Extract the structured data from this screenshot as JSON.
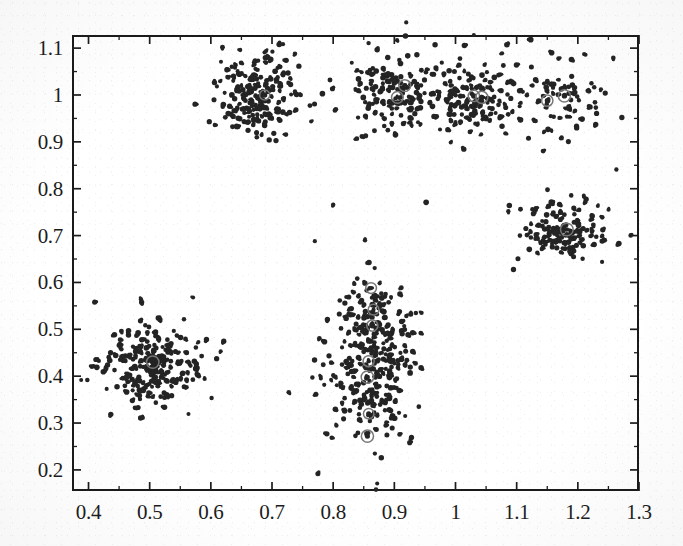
{
  "figure": {
    "kind": "scatter-plot",
    "background_color": "#ffffff",
    "ink_color": "#1c1c1c",
    "marker_color": "#242424"
  },
  "axes": {
    "frame": {
      "left_px": 72,
      "top_px": 35,
      "width_px": 567,
      "height_px": 456
    },
    "tick_direction": "in",
    "ticks_all_sides": true,
    "x_tick_labels": [
      "0.4",
      "0.5",
      "0.6",
      "0.7",
      "0.8",
      "0.9",
      "1",
      "1.1",
      "1.2",
      "1.3"
    ],
    "y_tick_labels": [
      "1.1",
      "1",
      "0.9",
      "0.8",
      "0.7",
      "0.6",
      "0.5",
      "0.4",
      "0.3",
      "0.2"
    ]
  },
  "chart_data": {
    "type": "scatter",
    "title": "",
    "xlabel": "",
    "ylabel": "",
    "xlim": [
      0.373,
      1.3
    ],
    "ylim": [
      0.155,
      1.128
    ],
    "xticks": [
      0.4,
      0.5,
      0.6,
      0.7,
      0.8,
      0.9,
      1.0,
      1.1,
      1.2,
      1.3
    ],
    "yticks": [
      0.2,
      0.3,
      0.4,
      0.5,
      0.6,
      0.7,
      0.8,
      0.9,
      1.0,
      1.1
    ],
    "xtick_labels": [
      "0.4",
      "0.5",
      "0.6",
      "0.7",
      "0.8",
      "0.9",
      "1",
      "1.1",
      "1.2",
      "1.3"
    ],
    "ytick_labels": [
      "0.2",
      "0.3",
      "0.4",
      "0.5",
      "0.6",
      "0.7",
      "0.8",
      "0.9",
      "1",
      "1.1"
    ],
    "grid": false,
    "legend": false,
    "marker": "dot",
    "marker_size_px": 4,
    "marker_color": "#242424",
    "series": [
      {
        "name": "cluster-upper-left",
        "center": [
          0.678,
          1.002
        ],
        "spread": [
          0.035,
          0.042
        ],
        "n": 205,
        "seed": 11
      },
      {
        "name": "cluster-upper-mid",
        "center": [
          0.905,
          1.005
        ],
        "spread": [
          0.04,
          0.044
        ],
        "n": 165,
        "seed": 23
      },
      {
        "name": "cluster-upper-right-a",
        "center": [
          1.035,
          0.995
        ],
        "spread": [
          0.032,
          0.04
        ],
        "n": 130,
        "seed": 37
      },
      {
        "name": "cluster-upper-right-b",
        "center": [
          1.175,
          0.995
        ],
        "spread": [
          0.035,
          0.04
        ],
        "n": 75,
        "seed": 53
      },
      {
        "name": "cluster-lower-left",
        "center": [
          0.503,
          0.424
        ],
        "spread": [
          0.04,
          0.042
        ],
        "n": 255,
        "seed": 67
      },
      {
        "name": "cluster-middle-lower",
        "center": [
          0.862,
          0.408
        ],
        "spread": [
          0.038,
          0.07
        ],
        "n": 230,
        "seed": 83
      },
      {
        "name": "cluster-middle-upper",
        "center": [
          0.866,
          0.525
        ],
        "spread": [
          0.032,
          0.043
        ],
        "n": 95,
        "seed": 97
      },
      {
        "name": "cluster-right",
        "center": [
          1.178,
          0.709
        ],
        "spread": [
          0.037,
          0.031
        ],
        "n": 150,
        "seed": 113
      }
    ],
    "highlighted_markers": [
      {
        "x": 0.917,
        "y": 1.02
      },
      {
        "x": 0.905,
        "y": 0.995
      },
      {
        "x": 1.03,
        "y": 0.998
      },
      {
        "x": 1.043,
        "y": 0.995
      },
      {
        "x": 1.15,
        "y": 0.988
      },
      {
        "x": 1.178,
        "y": 0.998
      },
      {
        "x": 0.688,
        "y": 1.0
      },
      {
        "x": 0.862,
        "y": 0.588
      },
      {
        "x": 0.866,
        "y": 0.542
      },
      {
        "x": 0.864,
        "y": 0.508
      },
      {
        "x": 0.858,
        "y": 0.432
      },
      {
        "x": 0.856,
        "y": 0.398
      },
      {
        "x": 0.858,
        "y": 0.32
      },
      {
        "x": 0.856,
        "y": 0.272
      },
      {
        "x": 1.182,
        "y": 0.713
      },
      {
        "x": 0.505,
        "y": 0.43
      }
    ],
    "outliers": [
      {
        "x": 1.03,
        "y": 1.128
      },
      {
        "x": 1.123,
        "y": 1.118
      },
      {
        "x": 1.258,
        "y": 1.079
      },
      {
        "x": 0.619,
        "y": 1.102
      },
      {
        "x": 0.648,
        "y": 1.096
      },
      {
        "x": 1.263,
        "y": 0.841
      },
      {
        "x": 0.8,
        "y": 0.766
      },
      {
        "x": 0.952,
        "y": 0.771
      },
      {
        "x": 1.088,
        "y": 0.764
      },
      {
        "x": 0.77,
        "y": 0.688
      },
      {
        "x": 0.852,
        "y": 0.69
      },
      {
        "x": 0.571,
        "y": 0.568
      },
      {
        "x": 0.41,
        "y": 0.558
      },
      {
        "x": 0.775,
        "y": 0.192
      },
      {
        "x": 0.872,
        "y": 0.171
      },
      {
        "x": 0.87,
        "y": 0.158
      },
      {
        "x": 0.388,
        "y": 0.392
      },
      {
        "x": 1.272,
        "y": 0.952
      }
    ]
  }
}
